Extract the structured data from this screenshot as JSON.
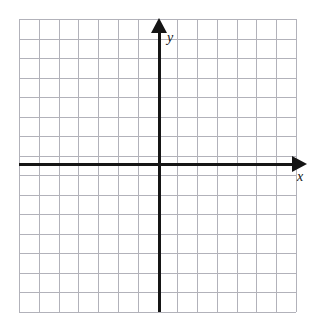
{
  "figure": {
    "kind": "cartesian-coordinate-grid",
    "width": 316,
    "height": 334,
    "background_color": "#ffffff"
  },
  "grid": {
    "color": "#b2b2ba",
    "line_width": 1,
    "cell_size": 19.7,
    "columns": 14,
    "rows": 15,
    "left": 19,
    "top": 19,
    "right": 296,
    "bottom": 312,
    "show": true
  },
  "axes": {
    "color": "#151515",
    "line_width": 3,
    "origin": {
      "x": 159,
      "y": 164
    },
    "x_axis": {
      "label": "x",
      "label_position": {
        "x": 297,
        "y": 170
      },
      "start_x": 19,
      "end_x": 292,
      "y": 164,
      "arrow": "right",
      "arrow_tip_x": 307
    },
    "y_axis": {
      "label": "y",
      "label_position": {
        "x": 167,
        "y": 31
      },
      "x": 159,
      "start_y": 312,
      "end_y": 33,
      "arrow": "up",
      "arrow_tip_y": 18
    }
  },
  "chart_data": {
    "type": "scatter",
    "title": "",
    "xlabel": "x",
    "ylabel": "y",
    "series": [],
    "x": [],
    "y": [],
    "xlim": [
      -7,
      7
    ],
    "ylim": [
      -8,
      7
    ],
    "xticks": [
      -7,
      -6,
      -5,
      -4,
      -3,
      -2,
      -1,
      0,
      1,
      2,
      3,
      4,
      5,
      6,
      7
    ],
    "yticks": [
      -8,
      -7,
      -6,
      -5,
      -4,
      -3,
      -2,
      -1,
      0,
      1,
      2,
      3,
      4,
      5,
      6,
      7
    ],
    "xtick_labels": [],
    "ytick_labels": [],
    "grid": true,
    "legend": false,
    "annotations": []
  }
}
